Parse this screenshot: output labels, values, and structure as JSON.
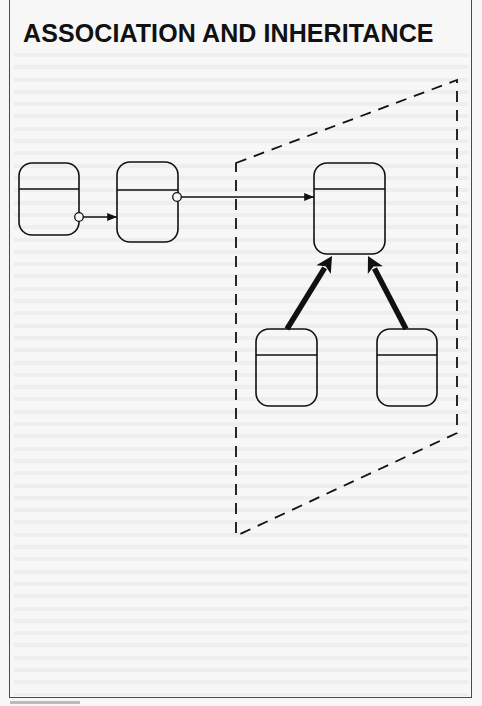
{
  "title": "ASSOCIATION AND INHERITANCE",
  "colors": {
    "background": "#f7f7f7",
    "ink": "#111111",
    "frame": "#4a4a4a"
  },
  "diagram": {
    "objects": [
      {
        "id": "object-a",
        "x": 19,
        "y": 163,
        "w": 60,
        "h": 72,
        "divider_y": 189
      },
      {
        "id": "object-b",
        "x": 117,
        "y": 162,
        "w": 61,
        "h": 80,
        "divider_y": 190
      },
      {
        "id": "superclass",
        "x": 314,
        "y": 163,
        "w": 71,
        "h": 91,
        "divider_y": 189
      },
      {
        "id": "subclass-left",
        "x": 256,
        "y": 329,
        "w": 61,
        "h": 77,
        "divider_y": 355
      },
      {
        "id": "subclass-right",
        "x": 377,
        "y": 329,
        "w": 60,
        "h": 77,
        "divider_y": 355
      }
    ],
    "associations": [
      {
        "from": "object-a",
        "to": "object-b",
        "port": [
          79,
          217
        ],
        "end": [
          117,
          217
        ]
      },
      {
        "from": "object-b",
        "to": "superclass",
        "port": [
          177,
          197
        ],
        "end": [
          314,
          197
        ]
      }
    ],
    "inheritance": [
      {
        "from": "subclass-left",
        "to": "superclass",
        "start": [
          287,
          329
        ],
        "end": [
          332,
          256
        ]
      },
      {
        "from": "subclass-right",
        "to": "superclass",
        "start": [
          406,
          329
        ],
        "end": [
          368,
          256
        ]
      }
    ],
    "hierarchy_boundary": {
      "style": "dashed",
      "points": [
        [
          236,
          163
        ],
        [
          457,
          80
        ],
        [
          457,
          433
        ],
        [
          236,
          536
        ]
      ]
    }
  }
}
